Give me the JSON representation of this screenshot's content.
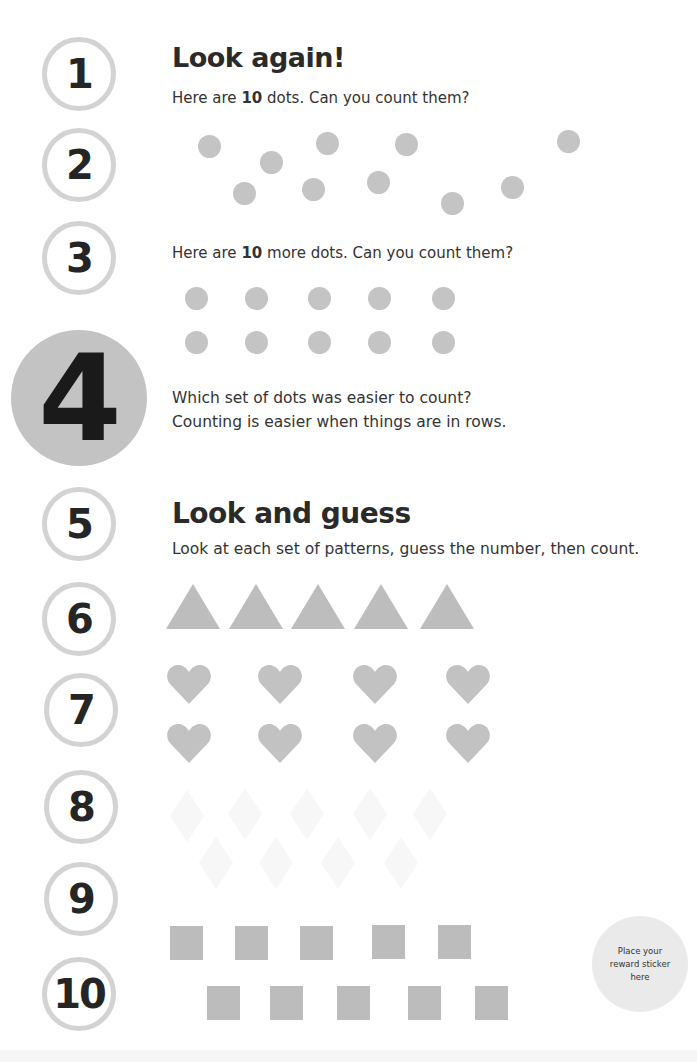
{
  "number_track": [
    "1",
    "2",
    "3",
    "4",
    "5",
    "6",
    "7",
    "8",
    "9",
    "10"
  ],
  "highlighted_number": "4",
  "section1": {
    "title": "Look again!",
    "prompt1": {
      "before": "Here are ",
      "bold": "10",
      "after": " dots. Can you count them?"
    },
    "prompt2": {
      "before": "Here are ",
      "bold": "10",
      "after": " more dots. Can you count them?"
    },
    "question_line1": "Which set of dots was easier to count?",
    "question_line2": "Counting is easier when things are in rows.",
    "scattered_dots_count": 10,
    "row_dots_count": 10
  },
  "section2": {
    "title": "Look and guess",
    "instruction": "Look at each set of patterns, guess the number, then count.",
    "patterns": [
      {
        "shape": "triangle",
        "count": 5
      },
      {
        "shape": "heart",
        "count": 8
      },
      {
        "shape": "diamond",
        "count": 9
      },
      {
        "shape": "square",
        "count": 10
      }
    ]
  },
  "sticker": {
    "text": "Place your reward sticker here"
  },
  "colors": {
    "shape_gray": "#c4c4c4",
    "ring_gray": "#d3d3d3",
    "highlight_gray": "#c3c3c3",
    "text": "#2a2a2a"
  }
}
